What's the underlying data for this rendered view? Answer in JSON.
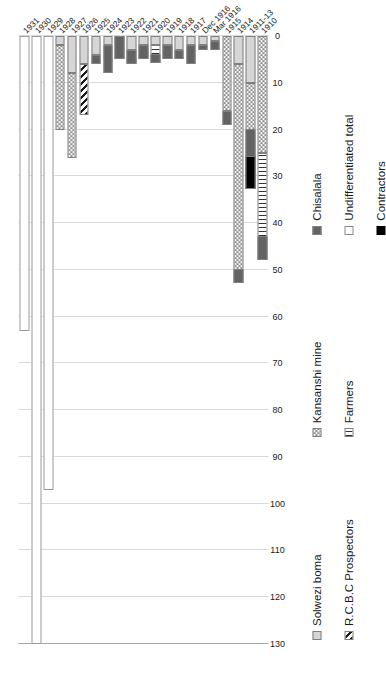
{
  "chart_data": {
    "type": "bar",
    "orientation": "horizontal-rotated",
    "title": "",
    "xlabel": "",
    "ylabel": "",
    "categories": [
      "1910",
      "1911-13",
      "1914",
      "1915",
      "Mar 1916",
      "Dec 1916",
      "1917",
      "1918",
      "1919",
      "1920",
      "1921",
      "1922",
      "1923",
      "1924",
      "1925",
      "1926",
      "1927",
      "1928",
      "1929",
      "1930",
      "1931"
    ],
    "series": [
      {
        "name": "Solwezi boma",
        "values": [
          0,
          10,
          6,
          0,
          1,
          2,
          2,
          3,
          2,
          2,
          2,
          3,
          0,
          2,
          4,
          6,
          8,
          2,
          0,
          0,
          0
        ]
      },
      {
        "name": "Kansanshi mine",
        "values": [
          25,
          10,
          44,
          16,
          0,
          0,
          0,
          0,
          0,
          0,
          0,
          0,
          0,
          0,
          0,
          0,
          18,
          18,
          0,
          0,
          0
        ]
      },
      {
        "name": "R.C.B.C Prospectors",
        "values": [
          0,
          0,
          0,
          0,
          0,
          0,
          0,
          0,
          0,
          0,
          0,
          0,
          0,
          0,
          0,
          11,
          0,
          0,
          0,
          0,
          0
        ]
      },
      {
        "name": "Farmers",
        "values": [
          18,
          0,
          0,
          0,
          0,
          0,
          0,
          0,
          0,
          2,
          0,
          0,
          0,
          0,
          0,
          0,
          0,
          0,
          0,
          0,
          0
        ]
      },
      {
        "name": "Chisalala",
        "values": [
          5,
          6,
          3,
          3,
          2,
          1,
          4,
          2,
          3,
          2,
          3,
          3,
          5,
          6,
          2,
          0,
          0,
          0,
          0,
          0,
          0
        ]
      },
      {
        "name": "Contractors",
        "values": [
          0,
          7,
          0,
          0,
          0,
          0,
          0,
          0,
          0,
          0,
          0,
          0,
          0,
          0,
          0,
          0,
          0,
          0,
          0,
          0,
          0
        ]
      },
      {
        "name": "Undifferentiated total",
        "values": [
          0,
          0,
          0,
          0,
          0,
          0,
          0,
          0,
          0,
          0,
          0,
          0,
          0,
          0,
          0,
          0,
          0,
          0,
          97,
          130,
          63
        ]
      }
    ],
    "ticks": [
      "130",
      "120",
      "110",
      "100",
      "90",
      "80",
      "70",
      "60",
      "50",
      "40",
      "30",
      "20",
      "10",
      "0"
    ],
    "xlim": [
      0,
      130
    ],
    "grid": true,
    "legend_position": "bottom",
    "colors": {
      "solwezi_boma": "#d6d6d6",
      "kansanshi_mine": "#f2f2f2",
      "rcbc_prospectors": "#ffffff",
      "farmers": "#ffffff",
      "chisalala": "#636363",
      "contractors": "#000000",
      "undifferentiated_total": "#ffffff",
      "gridline": "#d9d9d9",
      "axis": "#a6a6a6",
      "text": "#1a1a1a"
    }
  },
  "legend": {
    "items": [
      {
        "label": "Solwezi boma",
        "pattern": "p-solwezi"
      },
      {
        "label": "Kansanshi mine",
        "pattern": "p-kansanshi"
      },
      {
        "label": "Chisalala",
        "pattern": "p-chisalala"
      },
      {
        "label": "R.C.B.C Prospectors",
        "pattern": "p-rcbc"
      },
      {
        "label": "Farmers",
        "pattern": "p-farmers"
      },
      {
        "label": "Undifferentiated total",
        "pattern": "p-undiff"
      },
      {
        "label": "Contractors",
        "pattern": "p-contractors"
      }
    ]
  }
}
